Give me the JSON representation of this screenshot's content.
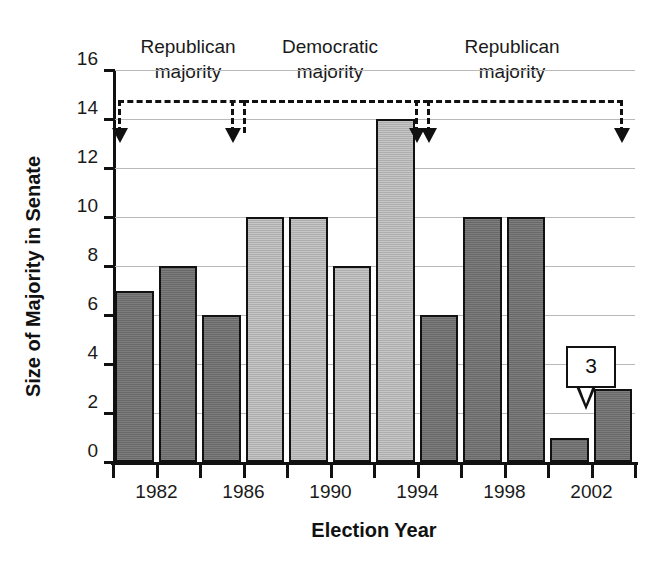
{
  "chart_data": {
    "type": "bar",
    "title": "",
    "xlabel": "Election Year",
    "ylabel": "Size of Majority in Senate",
    "ylim": [
      0,
      16
    ],
    "ytick_step": 2,
    "yticks": [
      0,
      2,
      4,
      6,
      8,
      10,
      12,
      14,
      16
    ],
    "grid": true,
    "legend": "none",
    "xlim": [
      1980,
      2004
    ],
    "xtick_step": 2,
    "xticks": [
      1980,
      1982,
      1984,
      1986,
      1988,
      1990,
      1992,
      1994,
      1996,
      1998,
      2000,
      2002,
      2004
    ],
    "xticklabels_shown": [
      "1982",
      "1986",
      "1990",
      "1994",
      "1998",
      "2002"
    ],
    "xticklabel_values": [
      1982,
      1986,
      1990,
      1994,
      1998,
      2002
    ],
    "categories": [
      1980,
      1982,
      1984,
      1986,
      1988,
      1990,
      1992,
      1994,
      1996,
      1998,
      2000,
      2002
    ],
    "values": [
      7,
      8,
      6,
      10,
      10,
      8,
      14,
      6,
      10,
      10,
      1,
      3
    ],
    "bar_party": [
      "Republican",
      "Republican",
      "Republican",
      "Democratic",
      "Democratic",
      "Democratic",
      "Democratic",
      "Republican",
      "Republican",
      "Republican",
      "Republican",
      "Republican"
    ],
    "series": [
      {
        "name": "Size of Majority in Senate",
        "values": [
          7,
          8,
          6,
          10,
          10,
          8,
          14,
          6,
          10,
          10,
          1,
          3
        ]
      }
    ],
    "annotations": [
      {
        "text": "3",
        "at_category": 2002,
        "value": 3,
        "style": "callout-bubble"
      }
    ],
    "regions": [
      {
        "label_line1": "Republican",
        "label_line2": "majority",
        "start": 1980,
        "end": 1986
      },
      {
        "label_line1": "Democratic",
        "label_line2": "majority",
        "start": 1986,
        "end": 1994
      },
      {
        "label_line1": "Republican",
        "label_line2": "majority",
        "start": 1994,
        "end": 2004
      }
    ]
  },
  "colors": {
    "bar_dark": "#6f6f6f",
    "bar_light": "#b6b6b6",
    "axis": "#111111",
    "gridline": "#b9b9b9",
    "background": "#ffffff",
    "text": "#1a1a1a"
  },
  "axes": {
    "y_title": "Size of Majority in Senate",
    "x_title": "Election Year",
    "y_labels": [
      "16",
      "14",
      "12",
      "10",
      "8",
      "6",
      "4",
      "2",
      "0"
    ],
    "x_labels": [
      "1982",
      "1986",
      "1990",
      "1994",
      "1998",
      "2002"
    ]
  },
  "regions_text": {
    "r1_line1": "Republican",
    "r1_line2": "majority",
    "r2_line1": "Democratic",
    "r2_line2": "majority",
    "r3_line1": "Republican",
    "r3_line2": "majority"
  },
  "callout": {
    "value": "3"
  }
}
